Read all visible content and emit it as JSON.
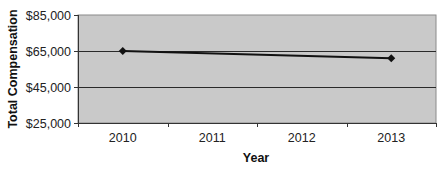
{
  "chart_data": {
    "type": "line",
    "title": "",
    "xlabel": "Year",
    "ylabel": "Total Compensation",
    "categories": [
      "2010",
      "2011",
      "2012",
      "2013"
    ],
    "series": [
      {
        "name": "Total Compensation",
        "points": [
          {
            "x": "2010",
            "y": 65000
          },
          {
            "x": "2013",
            "y": 61000
          }
        ],
        "color": "#111111",
        "marker": "diamond"
      }
    ],
    "ylim": [
      25000,
      85000
    ],
    "yticks": [
      25000,
      45000,
      65000,
      85000
    ],
    "ytick_labels": [
      "$25,000",
      "$45,000",
      "$65,000",
      "$85,000"
    ],
    "grid": "horizontal major",
    "legend": "none",
    "colors": {
      "plot_background": "#c9c9c9",
      "gridline": "#2a2a2a",
      "line": "#111111",
      "axis": "#333333"
    }
  }
}
